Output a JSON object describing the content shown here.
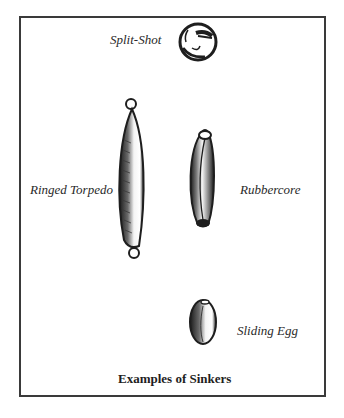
{
  "figure": {
    "caption": "Examples of Sinkers",
    "items": [
      {
        "label": "Split-Shot",
        "icon": "split-shot-sinker"
      },
      {
        "label": "Ringed Torpedo",
        "icon": "ringed-torpedo-sinker"
      },
      {
        "label": "Rubbercore",
        "icon": "rubbercore-sinker"
      },
      {
        "label": "Sliding Egg",
        "icon": "sliding-egg-sinker"
      }
    ]
  },
  "colors": {
    "ink": "#1e1e1e",
    "frame": "#3a3a3a",
    "background": "#ffffff"
  }
}
